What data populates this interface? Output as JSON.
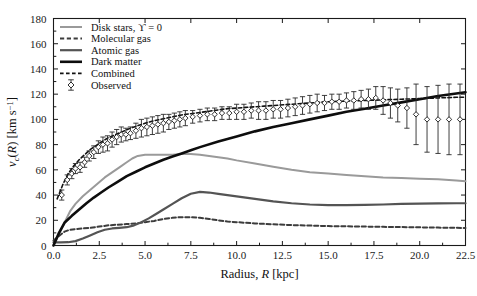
{
  "chart_data": {
    "type": "line",
    "title": "",
    "xlabel": "Radius, R [kpc]",
    "ylabel": "v_c(R) [km s^-1]",
    "xlabel_parts": {
      "prefix": "Radius, ",
      "italic": "R",
      "suffix": " [kpc]"
    },
    "ylabel_parts": {
      "italic_v": "v",
      "sub_c": "c",
      "paren_open": "(",
      "italic_R": "R",
      "paren_close": ")",
      "units": " [km s",
      "exp": "−1",
      "units_close": "]"
    },
    "xlim": [
      0.0,
      22.5
    ],
    "ylim": [
      0,
      180
    ],
    "xticks": [
      "0.0",
      "2.5",
      "5.0",
      "7.5",
      "10.0",
      "12.5",
      "15.0",
      "17.5",
      "20.0",
      "22.5"
    ],
    "xtick_values": [
      0.0,
      2.5,
      5.0,
      7.5,
      10.0,
      12.5,
      15.0,
      17.5,
      20.0,
      22.5
    ],
    "yticks": [
      "0",
      "20",
      "40",
      "60",
      "80",
      "100",
      "120",
      "140",
      "160",
      "180"
    ],
    "ytick_values": [
      0,
      20,
      40,
      60,
      80,
      100,
      120,
      140,
      160,
      180
    ],
    "grid": false,
    "legend_position": "upper left",
    "series": [
      {
        "name": "Disk stars, ϒ = 0",
        "key": "disk_stars",
        "color": "#9a9a9a",
        "style": "solid",
        "width": 2.0,
        "x": [
          0.0,
          0.3,
          0.6,
          0.9,
          1.2,
          1.6,
          2.0,
          2.4,
          2.8,
          3.2,
          3.6,
          4.0,
          4.3,
          4.6,
          5.0,
          5.5,
          6.0,
          6.5,
          7.0,
          7.5,
          8.0,
          8.5,
          9.0,
          9.5,
          10.0,
          11.0,
          12.0,
          13.0,
          14.0,
          15.0,
          16.0,
          17.0,
          18.0,
          19.0,
          20.0,
          21.0,
          22.0,
          22.5
        ],
        "y": [
          0,
          9,
          18,
          27,
          33,
          39,
          44,
          49,
          54,
          58,
          62,
          66,
          69,
          71,
          72,
          72,
          72,
          72,
          72.5,
          72.5,
          72,
          71,
          70,
          69,
          67.5,
          65,
          62.5,
          60,
          58,
          57,
          56,
          55,
          54,
          53.5,
          53,
          52.5,
          51.5,
          51
        ]
      },
      {
        "name": "Molecular gas",
        "key": "molecular_gas",
        "color": "#3c3c3c",
        "style": "dashed",
        "width": 2.0,
        "x": [
          0.0,
          0.3,
          0.6,
          0.9,
          1.2,
          1.6,
          2.0,
          2.5,
          3.0,
          3.5,
          4.0,
          4.5,
          5.0,
          5.5,
          6.0,
          6.5,
          7.0,
          7.5,
          8.0,
          8.5,
          9.0,
          9.5,
          10.0,
          11.0,
          12.0,
          13.0,
          14.0,
          15.0,
          16.0,
          17.0,
          18.0,
          19.0,
          20.0,
          21.0,
          22.0,
          22.5
        ],
        "y": [
          4,
          7.5,
          11,
          12.5,
          13,
          13.5,
          14,
          15,
          16,
          16.5,
          17,
          17.5,
          18.5,
          19.5,
          21,
          22,
          22.5,
          22.5,
          22,
          21,
          20,
          19,
          18.5,
          17.5,
          16.8,
          16.2,
          15.8,
          15.4,
          15.2,
          15.0,
          14.8,
          14.6,
          14.4,
          14.2,
          14.0,
          13.9
        ]
      },
      {
        "name": "Atomic gas",
        "key": "atomic_gas",
        "color": "#545454",
        "style": "solid",
        "width": 2.2,
        "x": [
          0.0,
          0.4,
          0.8,
          1.2,
          1.6,
          2.0,
          2.4,
          2.8,
          3.2,
          3.6,
          4.0,
          4.4,
          4.8,
          5.2,
          5.6,
          6.0,
          6.5,
          7.0,
          7.5,
          8.0,
          8.5,
          9.0,
          9.5,
          10.0,
          11.0,
          12.0,
          13.0,
          14.0,
          15.0,
          16.0,
          17.0,
          18.0,
          19.0,
          20.0,
          21.0,
          22.0,
          22.5
        ],
        "y": [
          2.5,
          2.5,
          2.6,
          3.5,
          5.5,
          8.0,
          10.5,
          12.5,
          13.5,
          14.0,
          14.5,
          16.0,
          18.5,
          21.5,
          25.0,
          28.5,
          33.0,
          37.5,
          41.0,
          42.5,
          42.0,
          41.0,
          40.0,
          39.0,
          37.0,
          35.0,
          33.5,
          32.5,
          32.0,
          32.0,
          32.2,
          32.5,
          33.0,
          33.2,
          33.4,
          33.5,
          33.5
        ]
      },
      {
        "name": "Dark matter",
        "key": "dark_matter",
        "color": "#0d0d0d",
        "style": "solid",
        "width": 2.6,
        "x": [
          0.0,
          0.3,
          0.6,
          1.0,
          1.4,
          1.8,
          2.2,
          2.6,
          3.0,
          3.5,
          4.0,
          4.5,
          5.0,
          5.5,
          6.0,
          6.5,
          7.0,
          7.5,
          8.0,
          9.0,
          10.0,
          11.0,
          12.0,
          13.0,
          14.0,
          15.0,
          16.0,
          17.0,
          18.0,
          19.0,
          20.0,
          21.0,
          22.0,
          22.5
        ],
        "y": [
          0,
          10,
          18,
          23.5,
          28.5,
          33.5,
          38.0,
          42.0,
          46.0,
          50.5,
          55.0,
          58.5,
          62.0,
          65.0,
          68.0,
          70.5,
          73.0,
          75.5,
          78.0,
          82.5,
          86.5,
          90.5,
          94.0,
          97.0,
          100.0,
          103.0,
          106.0,
          108.5,
          111.0,
          113.5,
          116.0,
          118.5,
          120.5,
          121.5
        ]
      },
      {
        "name": "Combined",
        "key": "combined",
        "color": "#111111",
        "style": "dashed",
        "width": 1.6,
        "x": [
          0.2,
          0.5,
          0.8,
          1.1,
          1.4,
          1.7,
          2.0,
          2.3,
          2.6,
          3.0,
          3.4,
          3.8,
          4.2,
          4.6,
          5.0,
          5.5,
          6.0,
          6.5,
          7.0,
          7.5,
          8.0,
          8.5,
          9.0,
          9.5,
          10.0,
          10.5,
          11.0,
          11.5,
          12.0,
          13.0,
          14.0,
          15.0,
          16.0,
          17.0,
          18.0,
          19.0,
          20.0,
          21.0,
          22.0,
          22.5
        ],
        "y": [
          37,
          48,
          57,
          63,
          68,
          72,
          76,
          79,
          82,
          85.5,
          88,
          90.5,
          93,
          95,
          97,
          99,
          100.5,
          102,
          103.5,
          104.5,
          105.5,
          106.5,
          107.5,
          108.5,
          109,
          109.5,
          110,
          110.5,
          111,
          112,
          113,
          114,
          114.5,
          115,
          115.5,
          116,
          116.5,
          117,
          117.5,
          117.5
        ]
      }
    ],
    "observed": {
      "name": "Observed",
      "marker": "diamond",
      "color": "#1a1a1a",
      "points": [
        {
          "x": 0.45,
          "y": 40,
          "err": 4
        },
        {
          "x": 0.75,
          "y": 52,
          "err": 4
        },
        {
          "x": 1.0,
          "y": 57,
          "err": 4
        },
        {
          "x": 1.2,
          "y": 61,
          "err": 4
        },
        {
          "x": 1.45,
          "y": 62,
          "err": 4
        },
        {
          "x": 1.7,
          "y": 66,
          "err": 4
        },
        {
          "x": 1.95,
          "y": 71,
          "err": 4
        },
        {
          "x": 2.2,
          "y": 74,
          "err": 5
        },
        {
          "x": 2.45,
          "y": 78,
          "err": 5
        },
        {
          "x": 2.7,
          "y": 80,
          "err": 6
        },
        {
          "x": 2.95,
          "y": 81,
          "err": 6
        },
        {
          "x": 3.2,
          "y": 84,
          "err": 6
        },
        {
          "x": 3.45,
          "y": 86,
          "err": 6
        },
        {
          "x": 3.7,
          "y": 88,
          "err": 6
        },
        {
          "x": 3.95,
          "y": 88,
          "err": 5
        },
        {
          "x": 4.2,
          "y": 89,
          "err": 5
        },
        {
          "x": 4.5,
          "y": 91,
          "err": 6
        },
        {
          "x": 4.8,
          "y": 93,
          "err": 7
        },
        {
          "x": 5.1,
          "y": 94,
          "err": 7
        },
        {
          "x": 5.4,
          "y": 95,
          "err": 7
        },
        {
          "x": 5.7,
          "y": 96,
          "err": 7
        },
        {
          "x": 6.0,
          "y": 97,
          "err": 7
        },
        {
          "x": 6.3,
          "y": 98,
          "err": 6
        },
        {
          "x": 6.6,
          "y": 99,
          "err": 6
        },
        {
          "x": 6.9,
          "y": 100,
          "err": 6
        },
        {
          "x": 7.2,
          "y": 101,
          "err": 6
        },
        {
          "x": 7.6,
          "y": 102,
          "err": 5
        },
        {
          "x": 8.0,
          "y": 103,
          "err": 5
        },
        {
          "x": 8.4,
          "y": 104,
          "err": 5
        },
        {
          "x": 8.8,
          "y": 104,
          "err": 5
        },
        {
          "x": 9.2,
          "y": 105,
          "err": 5
        },
        {
          "x": 9.6,
          "y": 105,
          "err": 5
        },
        {
          "x": 10.0,
          "y": 106,
          "err": 6
        },
        {
          "x": 10.4,
          "y": 106,
          "err": 6
        },
        {
          "x": 10.8,
          "y": 107,
          "err": 6
        },
        {
          "x": 11.2,
          "y": 107,
          "err": 7
        },
        {
          "x": 11.6,
          "y": 107,
          "err": 7
        },
        {
          "x": 12.0,
          "y": 108,
          "err": 7
        },
        {
          "x": 12.4,
          "y": 108,
          "err": 7
        },
        {
          "x": 12.8,
          "y": 109,
          "err": 7
        },
        {
          "x": 13.2,
          "y": 110,
          "err": 7
        },
        {
          "x": 13.6,
          "y": 111,
          "err": 7
        },
        {
          "x": 14.0,
          "y": 112,
          "err": 7
        },
        {
          "x": 14.4,
          "y": 113,
          "err": 7
        },
        {
          "x": 14.8,
          "y": 113,
          "err": 6
        },
        {
          "x": 15.2,
          "y": 114,
          "err": 6
        },
        {
          "x": 15.6,
          "y": 114,
          "err": 6
        },
        {
          "x": 16.0,
          "y": 115,
          "err": 6
        },
        {
          "x": 16.4,
          "y": 115,
          "err": 7
        },
        {
          "x": 16.8,
          "y": 116,
          "err": 7
        },
        {
          "x": 17.2,
          "y": 116,
          "err": 8
        },
        {
          "x": 17.6,
          "y": 117,
          "err": 9
        },
        {
          "x": 18.0,
          "y": 115,
          "err": 11
        },
        {
          "x": 18.4,
          "y": 113,
          "err": 12
        },
        {
          "x": 18.8,
          "y": 111,
          "err": 13
        },
        {
          "x": 19.3,
          "y": 109,
          "err": 16
        },
        {
          "x": 19.8,
          "y": 104,
          "err": 24
        },
        {
          "x": 20.4,
          "y": 100,
          "err": 26
        },
        {
          "x": 21.0,
          "y": 100,
          "err": 27
        },
        {
          "x": 21.6,
          "y": 100,
          "err": 28
        },
        {
          "x": 22.2,
          "y": 100,
          "err": 28
        }
      ]
    },
    "legend_entries": [
      {
        "label": "Disk stars, ϒ = 0",
        "key": "disk_stars",
        "color": "#9a9a9a",
        "style": "solid",
        "width": 2.0
      },
      {
        "label": "Molecular gas",
        "key": "molecular_gas",
        "color": "#3c3c3c",
        "style": "dashed",
        "width": 2.0
      },
      {
        "label": "Atomic gas",
        "key": "atomic_gas",
        "color": "#545454",
        "style": "solid",
        "width": 2.2
      },
      {
        "label": "Dark matter",
        "key": "dark_matter",
        "color": "#0d0d0d",
        "style": "solid",
        "width": 2.6
      },
      {
        "label": "Combined",
        "key": "combined",
        "color": "#111111",
        "style": "dashed",
        "width": 1.6
      },
      {
        "label": "Observed",
        "key": "observed",
        "color": "#1a1a1a",
        "style": "marker",
        "width": 1.0
      }
    ]
  }
}
